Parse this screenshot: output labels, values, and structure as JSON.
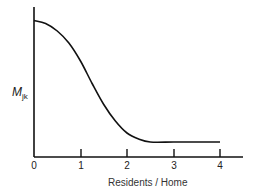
{
  "chart_data": {
    "type": "line",
    "title": "",
    "xlabel": "Residents / Home",
    "ylabel": "M",
    "ylabel_subscript": "jk",
    "x_ticks": [
      "0",
      "1",
      "2",
      "3",
      "4"
    ],
    "xlim": [
      0,
      4.5
    ],
    "ylim": [
      0,
      1
    ],
    "grid": false,
    "legend": null,
    "series": [
      {
        "name": "M_jk",
        "x": [
          0,
          0.25,
          0.5,
          0.75,
          1.0,
          1.25,
          1.5,
          1.75,
          2.0,
          2.25,
          2.5,
          3.0,
          3.5,
          4.0
        ],
        "y": [
          0.91,
          0.89,
          0.84,
          0.76,
          0.64,
          0.49,
          0.35,
          0.24,
          0.16,
          0.12,
          0.1,
          0.1,
          0.1,
          0.1
        ]
      }
    ],
    "annotations": []
  },
  "axes": {
    "y_label": "M",
    "y_label_sub": "jk",
    "x_label": "Residents / Home",
    "ticks": [
      "0",
      "1",
      "2",
      "3",
      "4"
    ]
  }
}
